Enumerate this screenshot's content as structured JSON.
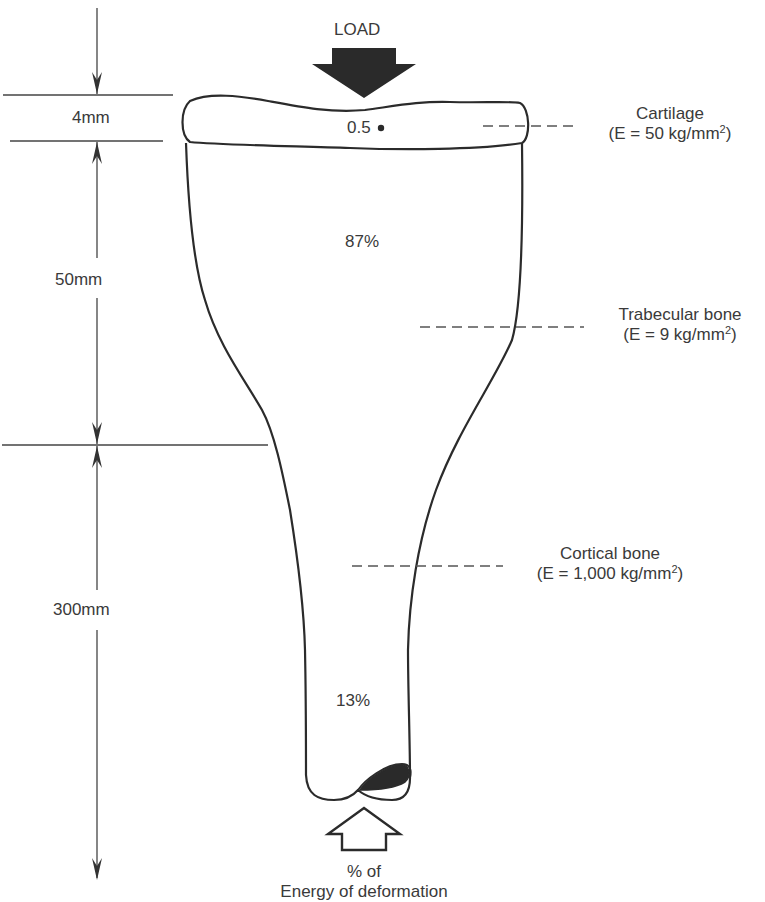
{
  "load": {
    "label": "LOAD",
    "color": "#2a2a2a"
  },
  "dimensions": [
    {
      "label": "4mm"
    },
    {
      "label": "50mm"
    },
    {
      "label": "300mm"
    }
  ],
  "regions": {
    "cartilage_value": "0.5",
    "trabecular_value": "87%",
    "cortical_value": "13%"
  },
  "materials": [
    {
      "name": "Cartilage",
      "modulus_prefix": "(E = 50 kg/mm",
      "modulus_exp": "2",
      "modulus_suffix": ")"
    },
    {
      "name": "Trabecular bone",
      "modulus_prefix": "(E = 9 kg/mm",
      "modulus_exp": "2",
      "modulus_suffix": ")"
    },
    {
      "name": "Cortical bone",
      "modulus_prefix": "(E = 1,000 kg/mm",
      "modulus_exp": "2",
      "modulus_suffix": ")"
    }
  ],
  "caption": {
    "line1": "% of",
    "line2": "Energy of deformation"
  },
  "colors": {
    "line": "#2b2b2b",
    "text": "#3a3a3a",
    "fill": "#2a2a2a"
  }
}
